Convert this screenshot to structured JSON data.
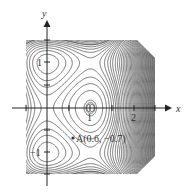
{
  "chart_data": {
    "type": "contour",
    "title": "",
    "xlabel": "x",
    "ylabel": "y",
    "x_ticks": [
      {
        "value": 1,
        "label": "1"
      },
      {
        "value": 2,
        "label": "2"
      }
    ],
    "y_ticks": [
      {
        "value": 1,
        "label": "1"
      },
      {
        "value": -1,
        "label": "−1"
      }
    ],
    "xlim": [
      -0.5,
      2.5
    ],
    "ylim": [
      -1.5,
      1.5
    ],
    "grid": false,
    "annotations": [
      {
        "text": "A(0.6, −0.7)",
        "x": 0.6,
        "y": -0.7,
        "marker": "dot"
      }
    ],
    "critical_points": [
      {
        "x": 1,
        "y": 0,
        "kind": "local extremum (closed contour)"
      }
    ],
    "contour_color": "#444444"
  },
  "labels": {
    "x_axis": "x",
    "y_axis": "y",
    "tick_x1": "1",
    "tick_x2": "2",
    "tick_y1": "1",
    "tick_ym1": "−1",
    "point_a": "A(0.6, −0.7)"
  }
}
